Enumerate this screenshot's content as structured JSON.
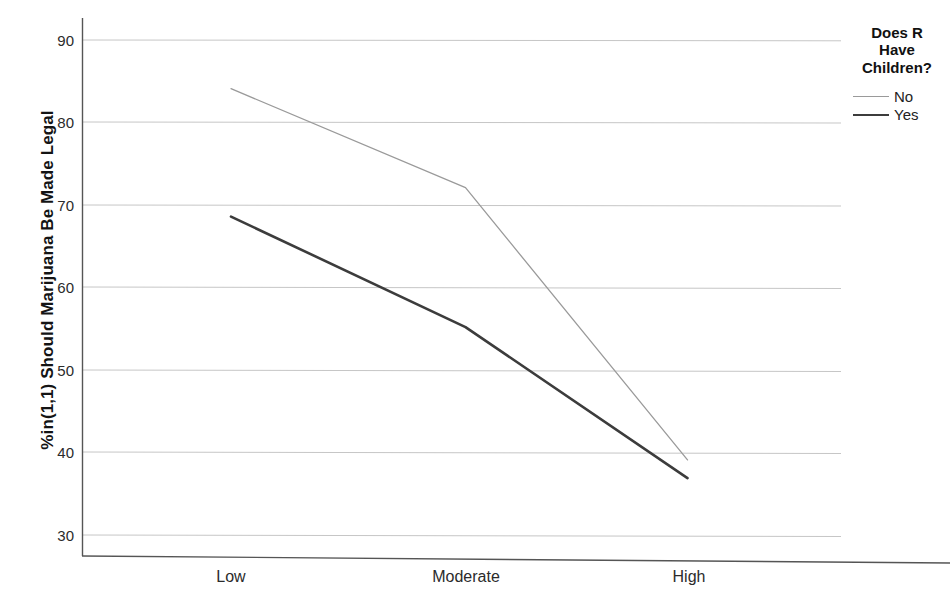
{
  "chart_data": {
    "type": "line",
    "title": "",
    "xlabel": "",
    "ylabel": "%in(1,1) Should Marijuana Be Made Legal",
    "categories": [
      "Low",
      "Moderate",
      "High"
    ],
    "ylim": [
      26,
      93
    ],
    "yticks": [
      30,
      40,
      50,
      60,
      70,
      80,
      90
    ],
    "ytick_labels": [
      "30",
      "40",
      "50",
      "60",
      "70",
      "80",
      "90"
    ],
    "grid": true,
    "legend_position": "right",
    "legend_title": "Does R Have Children?",
    "series": [
      {
        "name": "No",
        "values": [
          84.1,
          72.1,
          39.1
        ],
        "color": "#9a9a9a",
        "width": 1.3
      },
      {
        "name": "Yes",
        "values": [
          68.6,
          55.2,
          36.9
        ],
        "color": "#3c3c3c",
        "width": 2.6
      }
    ]
  },
  "axis": {
    "y_title": "%in(1,1) Should Marijuana Be Made Legal",
    "y_ticks": [
      {
        "label": "90"
      },
      {
        "label": "80"
      },
      {
        "label": "70"
      },
      {
        "label": "60"
      },
      {
        "label": "50"
      },
      {
        "label": "40"
      },
      {
        "label": "30"
      }
    ],
    "x_ticks": [
      {
        "label": "Low"
      },
      {
        "label": "Moderate"
      },
      {
        "label": "High"
      }
    ]
  },
  "legend": {
    "title_line_1": "Does R",
    "title_line_2": "Have",
    "title_line_3": "Children?",
    "items": [
      {
        "label": "No",
        "color": "#9a9a9a"
      },
      {
        "label": "Yes",
        "color": "#3c3c3c"
      }
    ]
  },
  "colors": {
    "axis": "#555555",
    "grid": "#c9c9c9",
    "series_no": "#9a9a9a",
    "series_yes": "#3c3c3c",
    "text": "#1a1a1a",
    "background": "#ffffff"
  }
}
